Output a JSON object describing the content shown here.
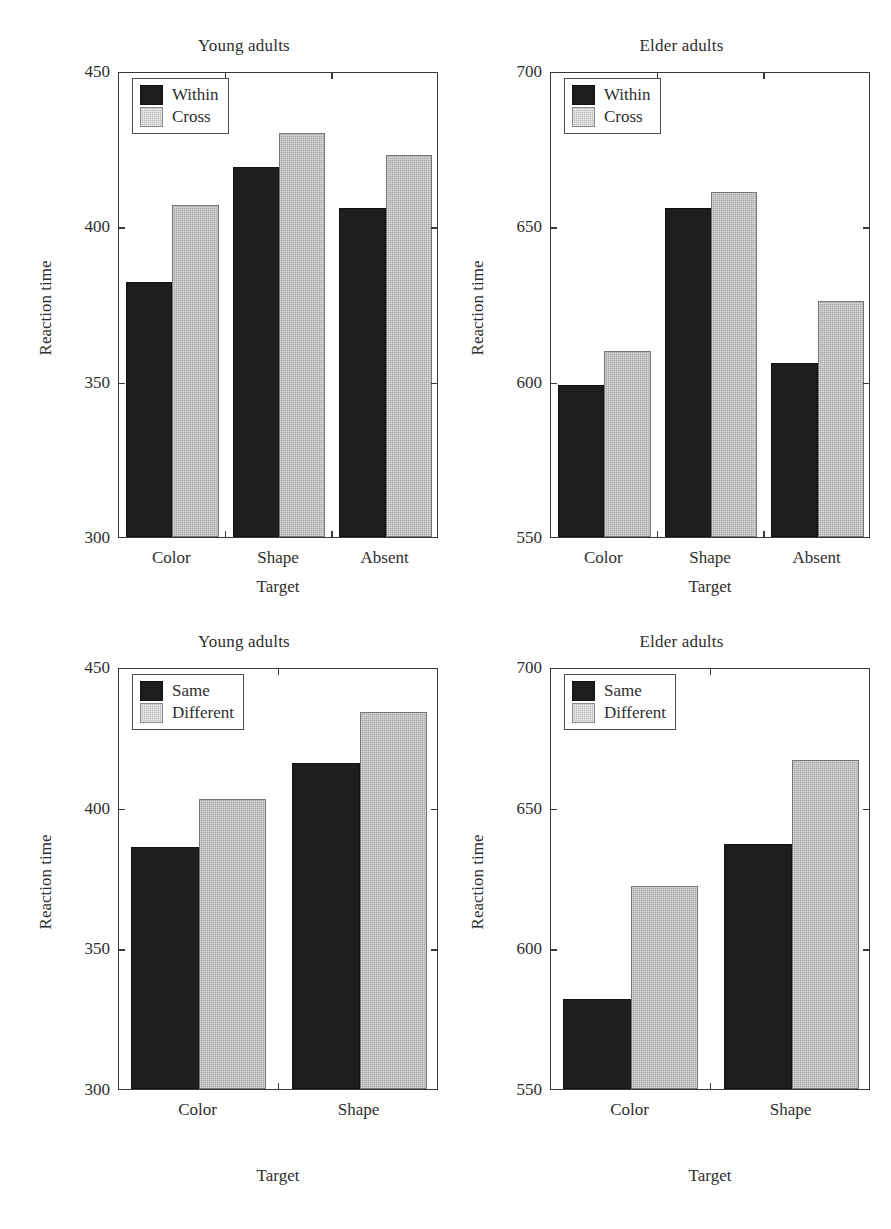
{
  "figure": {
    "background": "#ffffff",
    "series_colors": {
      "dark": "#1e1e1e",
      "light": "#a8a8a8"
    },
    "axis_color": "#3a3a3a"
  },
  "panels": [
    {
      "id": "top-left",
      "title": "Young adults",
      "ylabel": "Reaction time",
      "xlabel": "Target"
    },
    {
      "id": "top-right",
      "title": "Elder adults",
      "ylabel": "Reaction time",
      "xlabel": "Target"
    },
    {
      "id": "bottom-left",
      "title": "Young adults",
      "ylabel": "Reaction time",
      "xlabel": "Target"
    },
    {
      "id": "bottom-right",
      "title": "Elder adults",
      "ylabel": "Reaction time",
      "xlabel": "Target"
    }
  ],
  "chart_data": [
    {
      "type": "bar",
      "title": "Young adults",
      "xlabel": "Target",
      "ylabel": "Reaction time",
      "categories": [
        "Color",
        "Shape",
        "Absent"
      ],
      "series": [
        {
          "name": "Within",
          "values": [
            382,
            419,
            406
          ],
          "color": "#1e1e1e"
        },
        {
          "name": "Cross",
          "values": [
            407,
            430,
            423
          ],
          "color": "#a8a8a8"
        }
      ],
      "ylim": [
        300,
        450
      ],
      "yticks": [
        300,
        350,
        400,
        450
      ],
      "ytick_labels": [
        "300",
        "350",
        "400",
        "450"
      ],
      "grid": false,
      "legend_position": "upper left"
    },
    {
      "type": "bar",
      "title": "Elder adults",
      "xlabel": "Target",
      "ylabel": "Reaction time",
      "categories": [
        "Color",
        "Shape",
        "Absent"
      ],
      "series": [
        {
          "name": "Within",
          "values": [
            599,
            656,
            606
          ],
          "color": "#1e1e1e"
        },
        {
          "name": "Cross",
          "values": [
            610,
            661,
            626
          ],
          "color": "#a8a8a8"
        }
      ],
      "ylim": [
        550,
        700
      ],
      "yticks": [
        550,
        600,
        650,
        700
      ],
      "ytick_labels": [
        "550",
        "600",
        "650",
        "700"
      ],
      "grid": false,
      "legend_position": "upper left"
    },
    {
      "type": "bar",
      "title": "Young adults",
      "xlabel": "Target",
      "ylabel": "Reaction time",
      "categories": [
        "Color",
        "Shape"
      ],
      "series": [
        {
          "name": "Same",
          "values": [
            386,
            416
          ],
          "color": "#1e1e1e"
        },
        {
          "name": "Different",
          "values": [
            403,
            434
          ],
          "color": "#a8a8a8"
        }
      ],
      "ylim": [
        300,
        450
      ],
      "yticks": [
        300,
        350,
        400,
        450
      ],
      "ytick_labels": [
        "300",
        "350",
        "400",
        "450"
      ],
      "grid": false,
      "legend_position": "upper left"
    },
    {
      "type": "bar",
      "title": "Elder adults",
      "xlabel": "Target",
      "ylabel": "Reaction time",
      "categories": [
        "Color",
        "Shape"
      ],
      "series": [
        {
          "name": "Same",
          "values": [
            582,
            637
          ],
          "color": "#1e1e1e"
        },
        {
          "name": "Different",
          "values": [
            622,
            667
          ],
          "color": "#a8a8a8"
        }
      ],
      "ylim": [
        550,
        700
      ],
      "yticks": [
        550,
        600,
        650,
        700
      ],
      "ytick_labels": [
        "550",
        "600",
        "650",
        "700"
      ],
      "grid": false,
      "legend_position": "upper left"
    }
  ]
}
